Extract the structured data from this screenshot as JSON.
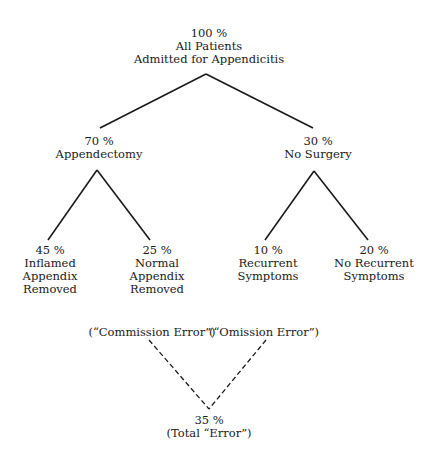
{
  "diagram": {
    "root": {
      "percent": "100 %",
      "lines": [
        "All Patients",
        "Admitted for Appendicitis"
      ]
    },
    "branches": [
      {
        "percent": "70 %",
        "lines": [
          "Appendectomy"
        ],
        "children": [
          {
            "percent": "45 %",
            "lines": [
              "Inflamed",
              "Appendix",
              "Removed"
            ]
          },
          {
            "percent": "25 %",
            "lines": [
              "Normal",
              "Appendix",
              "Removed"
            ]
          }
        ]
      },
      {
        "percent": "30 %",
        "lines": [
          "No Surgery"
        ],
        "children": [
          {
            "percent": "10 %",
            "lines": [
              "Recurrent",
              "Symptoms"
            ]
          },
          {
            "percent": "20 %",
            "lines": [
              "No Recurrent",
              "Symptoms"
            ]
          }
        ]
      }
    ],
    "error_labels": {
      "commission": "(“Commission Error”)",
      "omission": "(“Omission Error”)"
    },
    "total": {
      "percent": "35 %",
      "label": "(Total “Error”)"
    }
  }
}
